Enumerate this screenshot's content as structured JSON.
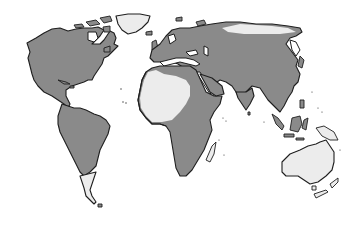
{
  "map": {
    "type": "world-distribution-map",
    "projection": "equirectangular-style",
    "legend": [],
    "colors": {
      "present_region": "#8a8a8a",
      "absent_region": "#ececec",
      "outline": "#1e1e1e",
      "ocean": "#ffffff"
    },
    "regions": [
      {
        "name": "North America",
        "status": "present"
      },
      {
        "name": "Greenland",
        "status": "absent"
      },
      {
        "name": "Central America",
        "status": "present"
      },
      {
        "name": "South America",
        "status": "present"
      },
      {
        "name": "Southern South America (Patagonia)",
        "status": "absent"
      },
      {
        "name": "Europe",
        "status": "present"
      },
      {
        "name": "Northern Siberia (Arctic coast)",
        "status": "absent"
      },
      {
        "name": "Asia",
        "status": "present"
      },
      {
        "name": "Sahara / North Africa interior",
        "status": "absent"
      },
      {
        "name": "Sub-Saharan Africa",
        "status": "present"
      },
      {
        "name": "Madagascar",
        "status": "absent"
      },
      {
        "name": "Southeast Asia (Malaysia, Sumatra, Borneo)",
        "status": "present"
      },
      {
        "name": "New Guinea",
        "status": "absent"
      },
      {
        "name": "Australia",
        "status": "absent"
      },
      {
        "name": "New Zealand",
        "status": "absent"
      }
    ]
  }
}
